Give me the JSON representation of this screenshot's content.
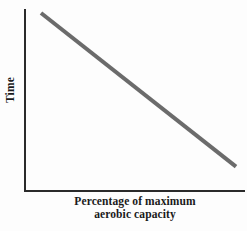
{
  "chart_data": {
    "type": "line",
    "title": "",
    "subtitle": "",
    "xlabel_line1": "Percentage of maximum",
    "xlabel_line2": "aerobic capacity",
    "xlabel": "Percentage of maximum aerobic capacity",
    "ylabel": "Time",
    "x": [
      0,
      100
    ],
    "series": [
      {
        "name": "Time vs percentage of maximum aerobic capacity",
        "values": [
          100,
          8
        ],
        "color": "#6b6b6b",
        "line_width_px": 4,
        "style": "solid",
        "relationship": "negative linear"
      }
    ],
    "xlim": [
      0,
      100
    ],
    "ylim": [
      0,
      100
    ],
    "x_ticks": [],
    "y_ticks": [],
    "x_tick_labels": [],
    "y_tick_labels": [],
    "grid": false,
    "legend": false,
    "legend_position": "none",
    "annotations": [],
    "axis_color": "#2a2a2a",
    "background_color": "#fdfdfd"
  }
}
